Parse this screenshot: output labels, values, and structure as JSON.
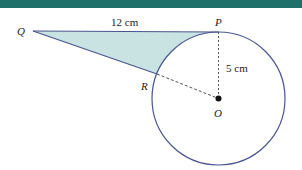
{
  "header": {
    "color": "#1f6f6a"
  },
  "colors": {
    "stroke": "#4a5590",
    "shade": "#c8e3e1",
    "dashed": "#555555",
    "text": "#222222"
  },
  "labels": {
    "Q": "Q",
    "P": "P",
    "R": "R",
    "O": "O",
    "QP_length": "12 cm",
    "OP_length": "5 cm"
  },
  "geometry": {
    "circle": {
      "cx": 218.5,
      "cy": 98.5,
      "r": 66.5
    },
    "Q": [
      33,
      31
    ],
    "P": [
      218.5,
      32
    ],
    "R": [
      157,
      74
    ],
    "O": [
      218.5,
      98.5
    ]
  }
}
